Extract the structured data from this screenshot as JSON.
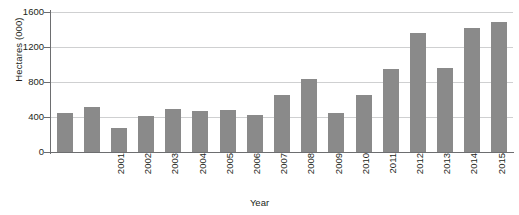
{
  "chart_data": {
    "type": "bar",
    "title": "",
    "xlabel": "Year",
    "ylabel": "Hectares (000)",
    "categories": [
      "2001",
      "2002",
      "2003",
      "2004",
      "2005",
      "2006",
      "2007",
      "2008",
      "2009",
      "2010",
      "2011",
      "2012",
      "2013",
      "2014",
      "2015",
      "2016",
      "2017"
    ],
    "values": [
      450,
      520,
      280,
      415,
      495,
      470,
      480,
      420,
      650,
      830,
      450,
      655,
      945,
      1355,
      955,
      1420,
      1490
    ],
    "ylim": [
      0,
      1600
    ],
    "yticks": [
      0,
      400,
      800,
      1200,
      1600
    ],
    "ytick_labels": [
      "0",
      "400",
      "800",
      "1200",
      "1600"
    ],
    "grid": true,
    "legend": "none",
    "series_color": "#8a8a8a",
    "gridline_color": "#cfd0d1",
    "axis_color": "#6d6e70",
    "background_color": "#ffffff"
  },
  "axes": {
    "y_title": "Hectares (000)",
    "x_title": "Year"
  },
  "footer": {
    "note": ""
  }
}
